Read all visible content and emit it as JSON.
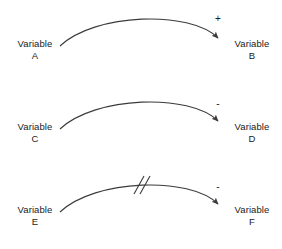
{
  "diagram": {
    "type": "causal-loop-diagram",
    "background_color": "#ffffff",
    "line_color": "#3b3b3b",
    "text_color": "#1a1a1a",
    "relationships": [
      {
        "id": "row-1",
        "source": {
          "name": "Variable",
          "sub": "A"
        },
        "target": {
          "name": "Variable",
          "sub": "B"
        },
        "polarity": "+",
        "delay": false
      },
      {
        "id": "row-2",
        "source": {
          "name": "Variable",
          "sub": "C"
        },
        "target": {
          "name": "Variable",
          "sub": "D"
        },
        "polarity": "-",
        "delay": false
      },
      {
        "id": "row-3",
        "source": {
          "name": "Variable",
          "sub": "E"
        },
        "target": {
          "name": "Variable",
          "sub": "F"
        },
        "polarity": "-",
        "delay": true,
        "delay_marker": "//"
      }
    ]
  }
}
